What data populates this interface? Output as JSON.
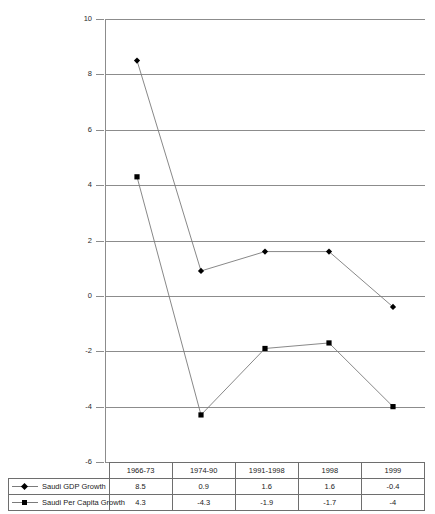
{
  "chart_data": {
    "type": "line",
    "title": "",
    "xlabel": "",
    "ylabel": "",
    "ylim": [
      -6,
      10
    ],
    "yticks": [
      10,
      8,
      6,
      4,
      2,
      0,
      -2,
      -4,
      -6
    ],
    "ytick_labels": [
      "10",
      "8",
      "6",
      "4",
      "2",
      "0",
      "-2",
      "-4",
      "-6"
    ],
    "grid": true,
    "legend_position": "table-below",
    "categories": [
      "1966-73",
      "1974-90",
      "1991-1998",
      "1998",
      "1999"
    ],
    "series": [
      {
        "name": "Saudi GDP Growth",
        "marker": "diamond",
        "values": [
          8.5,
          0.9,
          1.6,
          1.6,
          -0.4
        ],
        "value_labels": [
          "8.5",
          "0.9",
          "1.6",
          "1.6",
          "-0.4"
        ]
      },
      {
        "name": "Saudi Per Capita Growth",
        "marker": "square",
        "values": [
          4.3,
          -4.3,
          -1.9,
          -1.7,
          -4.0
        ],
        "value_labels": [
          "4.3",
          "-4.3",
          "-1.9",
          "-1.7",
          "-4"
        ]
      }
    ],
    "colors": {
      "line": "#7b7b7b",
      "marker": "#000000",
      "grid": "#8c8c8c",
      "axis": "#8c8c8c",
      "table_border": "#6e6e6e",
      "text": "#1a1a1a",
      "background": "#ffffff"
    }
  },
  "table": {
    "header_row": [
      "",
      "1966-73",
      "1974-90",
      "1991-1998",
      "1998",
      "1999"
    ],
    "rows": [
      {
        "label": "Saudi GDP Growth",
        "marker": "diamond",
        "cells": [
          "8.5",
          "0.9",
          "1.6",
          "1.6",
          "-0.4"
        ]
      },
      {
        "label": "Saudi Per Capita Growth",
        "marker": "square",
        "cells": [
          "4.3",
          "-4.3",
          "-1.9",
          "-1.7",
          "-4"
        ]
      }
    ]
  }
}
